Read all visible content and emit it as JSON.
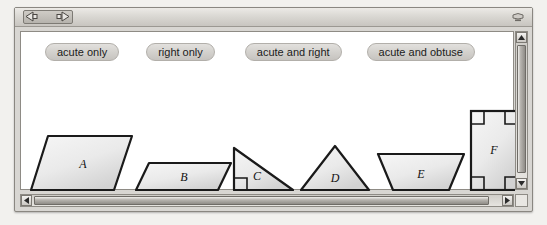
{
  "window": {
    "nav": {
      "back_icon": "left-arrow-icon",
      "forward_icon": "right-arrow-icon"
    },
    "titlebar_widget_icon": "widget-icon"
  },
  "buttons": [
    {
      "id": "acute-only",
      "label": "acute only"
    },
    {
      "id": "right-only",
      "label": "right only"
    },
    {
      "id": "acute-and-right",
      "label": "acute and right"
    },
    {
      "id": "acute-and-obtuse",
      "label": "acute and obtuse"
    }
  ],
  "shapes": [
    {
      "id": "A",
      "label": "A",
      "kind": "parallelogram"
    },
    {
      "id": "B",
      "label": "B",
      "kind": "parallelogram"
    },
    {
      "id": "C",
      "label": "C",
      "kind": "right-triangle"
    },
    {
      "id": "D",
      "label": "D",
      "kind": "acute-triangle"
    },
    {
      "id": "E",
      "label": "E",
      "kind": "trapezoid"
    },
    {
      "id": "F",
      "label": "F",
      "kind": "rectangle"
    }
  ],
  "scrollbars": {
    "vertical": {
      "up_icon": "scroll-up-arrow-icon",
      "down_icon": "scroll-down-arrow-icon"
    },
    "horizontal": {
      "left_icon": "scroll-left-arrow-icon",
      "right_icon": "scroll-right-arrow-icon"
    }
  },
  "colors": {
    "shape_fill_light": "#f4f4f4",
    "shape_fill_dark": "#d5d5d5",
    "shape_stroke": "#1a1a1a",
    "pill_face": "#d5d3cf",
    "window_chrome": "#d8d6d2"
  }
}
